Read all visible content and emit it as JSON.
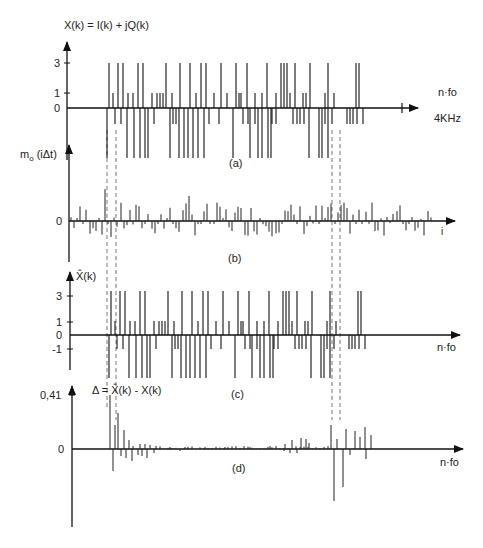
{
  "panels": [
    {
      "id": "a",
      "caption": "(a)",
      "y_label": "X(k) = I(k) + jQ(k)",
      "x_label": "n·fo",
      "x_end_label": "4KHz",
      "y_ticks": [
        "3",
        "1",
        "0"
      ],
      "axis_y": 108,
      "unit_px": 14
    },
    {
      "id": "b",
      "caption": "(b)",
      "y_label": "m",
      "y_label_sub": "o",
      "y_label_arg": "(iΔt)",
      "x_label": "i",
      "y_ticks": [
        "0"
      ],
      "axis_y": 221
    },
    {
      "id": "c",
      "caption": "(c)",
      "y_label": "X̂(k)",
      "x_label": "n·fo",
      "y_ticks": [
        "3",
        "1",
        "0",
        "-1"
      ],
      "axis_y": 335,
      "unit_px": 14
    },
    {
      "id": "d",
      "caption": "(d)",
      "y_label": "Δ = X̂(k) - X(k)",
      "x_label": "n·fo",
      "y_ticks": [
        "0,41",
        "0"
      ],
      "axis_y": 449
    }
  ],
  "chart_data": [
    {
      "type": "bar",
      "title": "(a) X(k) = I(k) + jQ(k)",
      "xlabel": "n·fo",
      "ylabel": "X(k)",
      "x_end": "4KHz",
      "y_ticks": [
        3,
        1,
        0
      ],
      "ylim": [
        -3,
        3.5
      ],
      "note": "16-QAM symbol spectrum; stems at levels ±1, ±3 between ~fo index 107 and 385 px",
      "pos_x": [
        109,
        113,
        118,
        123,
        128,
        133,
        138,
        143,
        152,
        157,
        160,
        163,
        166,
        172,
        180,
        190,
        196,
        201,
        206,
        214,
        221,
        227,
        236,
        239,
        241,
        247,
        255,
        262,
        267,
        276,
        281,
        284,
        287,
        290,
        295,
        303,
        306,
        310,
        325,
        328,
        334,
        356,
        359
      ],
      "pos_v": [
        3,
        1,
        3,
        3,
        1,
        1,
        3,
        3,
        1,
        1,
        1,
        1,
        3,
        1,
        3,
        3,
        1,
        3,
        3,
        1,
        3,
        1,
        3,
        1,
        1,
        3,
        1,
        1,
        3,
        1,
        3,
        3,
        3,
        1,
        3,
        1,
        1,
        3,
        1,
        3,
        1,
        3,
        3
      ],
      "neg_x": [
        107,
        115,
        121,
        127,
        134,
        140,
        145,
        148,
        154,
        170,
        173,
        176,
        179,
        184,
        188,
        193,
        198,
        204,
        209,
        219,
        233,
        243,
        248,
        250,
        255,
        258,
        262,
        268,
        271,
        272,
        276,
        293,
        297,
        300,
        304,
        309,
        319,
        322,
        325,
        328,
        332,
        347,
        350,
        353,
        357,
        363
      ],
      "neg_v": [
        -3,
        -1,
        -1,
        -3,
        -3,
        -3,
        -3,
        -3,
        -1,
        -3,
        -1,
        -1,
        -3,
        -3,
        -3,
        -3,
        -3,
        -3,
        -1,
        -1,
        -3,
        -1,
        -1,
        -3,
        -1,
        -3,
        -3,
        -3,
        -3,
        -1,
        -1,
        -1,
        -1,
        -1,
        -1,
        -3,
        -3,
        -3,
        -1,
        -3,
        -1,
        -1,
        -1,
        -1,
        -1,
        -1
      ]
    },
    {
      "type": "bar",
      "title": "(b) m_o(iΔt)",
      "xlabel": "i",
      "ylabel": "m_o(iΔt)",
      "y_ticks": [
        0
      ],
      "note": "time-domain multiplexed signal samples, noise-like stems around zero"
    },
    {
      "type": "bar",
      "title": "(c) X̂(k)",
      "xlabel": "n·fo",
      "ylabel": "X̂(k)",
      "y_ticks": [
        3,
        1,
        0,
        -1
      ],
      "ylim": [
        -3,
        3.5
      ],
      "note": "reconstructed symbol spectrum, same levels as (a)"
    },
    {
      "type": "bar",
      "title": "(d) Δ = X̂(k) - X(k)",
      "xlabel": "n·fo",
      "ylabel": "Δ",
      "y_ticks": [
        0.41,
        0
      ],
      "ylim": [
        -0.41,
        0.41
      ],
      "note": "error spectrum: large spikes (up to 0.41) at band edges ~x=110 and ~x=335, near-zero elsewhere"
    }
  ],
  "guides": {
    "dashed_left_x": [
      107,
      116
    ],
    "dashed_right_x": [
      332,
      340
    ]
  }
}
